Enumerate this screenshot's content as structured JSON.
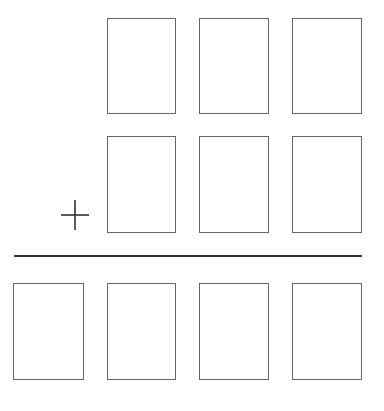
{
  "problem": {
    "type": "column-addition",
    "operator": "+",
    "operator_icon": "plus-icon",
    "colors": {
      "box_border": "#666666",
      "rule": "#333333",
      "operator": "#333333"
    },
    "rows": [
      {
        "name": "addend-1",
        "boxes": [
          {
            "x": 107,
            "y": 18,
            "w": 69,
            "h": 96,
            "value": ""
          },
          {
            "x": 199,
            "y": 18,
            "w": 70,
            "h": 96,
            "value": ""
          },
          {
            "x": 292,
            "y": 18,
            "w": 70,
            "h": 96,
            "value": ""
          }
        ]
      },
      {
        "name": "addend-2",
        "boxes": [
          {
            "x": 107,
            "y": 136,
            "w": 69,
            "h": 97,
            "value": ""
          },
          {
            "x": 199,
            "y": 136,
            "w": 70,
            "h": 97,
            "value": ""
          },
          {
            "x": 292,
            "y": 136,
            "w": 70,
            "h": 97,
            "value": ""
          }
        ]
      },
      {
        "name": "sum",
        "boxes": [
          {
            "x": 13,
            "y": 283,
            "w": 71,
            "h": 97,
            "value": ""
          },
          {
            "x": 107,
            "y": 283,
            "w": 69,
            "h": 97,
            "value": ""
          },
          {
            "x": 199,
            "y": 283,
            "w": 70,
            "h": 97,
            "value": ""
          },
          {
            "x": 292,
            "y": 283,
            "w": 70,
            "h": 97,
            "value": ""
          }
        ]
      }
    ]
  }
}
